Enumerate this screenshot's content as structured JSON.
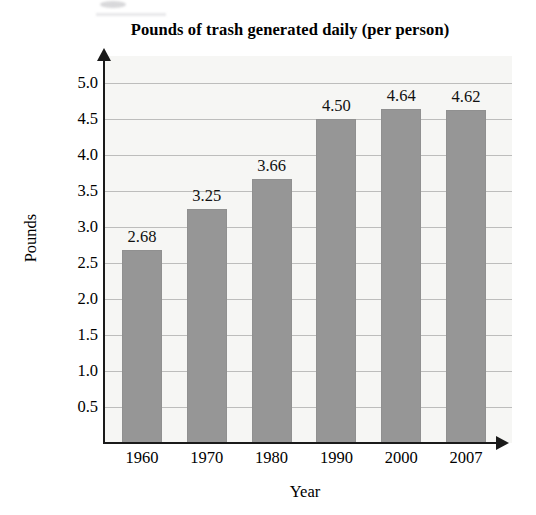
{
  "chart_data": {
    "type": "bar",
    "title": "Pounds of trash generated daily (per person)",
    "xlabel": "Year",
    "ylabel": "Pounds",
    "categories": [
      "1960",
      "1970",
      "1980",
      "1990",
      "2000",
      "2007"
    ],
    "values": [
      2.68,
      3.25,
      3.66,
      4.5,
      4.64,
      4.62
    ],
    "value_labels": [
      "2.68",
      "3.25",
      "3.66",
      "4.50",
      "4.64",
      "4.62"
    ],
    "ylim": [
      0,
      5.25
    ],
    "ytick_values": [
      0.5,
      1.0,
      1.5,
      2.0,
      2.5,
      3.0,
      3.5,
      4.0,
      4.5,
      5.0
    ],
    "ytick_labels": [
      "0.5",
      "1.0",
      "1.5",
      "2.0",
      "2.5",
      "3.0",
      "3.5",
      "4.0",
      "4.5",
      "5.0"
    ],
    "grid": true,
    "legend": false,
    "bar_color": "#969696",
    "plot_background": "#f6f6f4",
    "axis_color": "#1a1a1a",
    "gridline_color": "#9a9a9a"
  }
}
